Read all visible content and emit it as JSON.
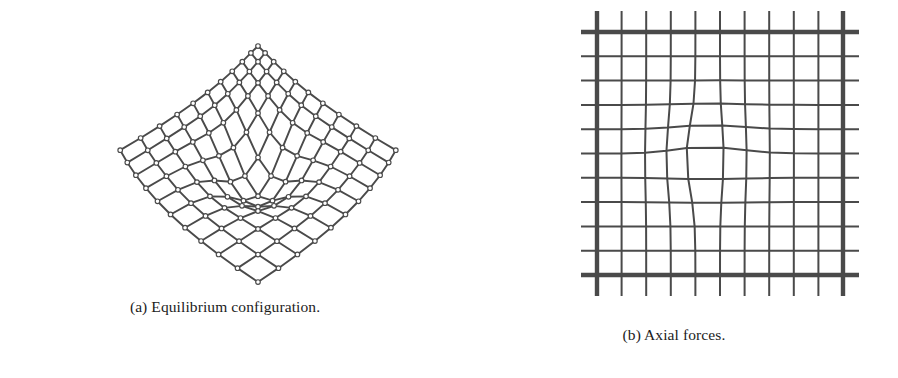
{
  "figure": {
    "kind": "two-panel-scientific-figure",
    "background_color": "#ffffff",
    "line_color": "#4a4a4a",
    "node_stroke_color": "#4a4a4a",
    "node_fill_color": "#ffffff",
    "caption_color": "#1c1c1c"
  },
  "panels": [
    {
      "id": "a",
      "caption": "(a) Equilibrium configuration.",
      "type": "perspective-bar-net",
      "description": "Perspective view of a diagonal cable/bar net in its equilibrium (funnel) shape with circular joint markers",
      "grid_n": 11,
      "bar_width": 1.9,
      "node_radius": 2.3,
      "funnel_apex": {
        "x": 258,
        "y": 148
      },
      "ridge_y": 46
    },
    {
      "id": "b",
      "caption": "(b) Axial forces.",
      "type": "force-thickness-grid",
      "description": "Plan view of the net where line thickness is proportional to axial force magnitude",
      "grid_rows": 11,
      "grid_cols": 11,
      "bounds": {
        "x0": 597,
        "y0": 32,
        "x1": 843,
        "y1": 275
      },
      "overhang": 16,
      "edge_line_width": 4.4,
      "interior_line_width": 2.0
    }
  ],
  "chart_data": {
    "type": "diagram",
    "title": "",
    "subfigures": [
      {
        "label": "(a)",
        "caption": "(a) Equilibrium configuration.",
        "plot_type": "3d-wireframe-net",
        "nodes": 121,
        "grid": [
          11,
          11
        ],
        "notes": "Diagonally oriented square net drawn in perspective; interior node pulled down forming a funnel apex near image center."
      },
      {
        "label": "(b)",
        "caption": "(b) Axial forces.",
        "plot_type": "line-width-encoded-grid",
        "grid": [
          11,
          11
        ],
        "encoding": "line thickness proportional to axial force",
        "edge_force_relative": 1.0,
        "interior_force_relative": 0.45,
        "notes": "Boundary members carry the largest axial forces (thickest lines); interior members thinner; a local kink appears near the centre of the grid."
      }
    ]
  }
}
